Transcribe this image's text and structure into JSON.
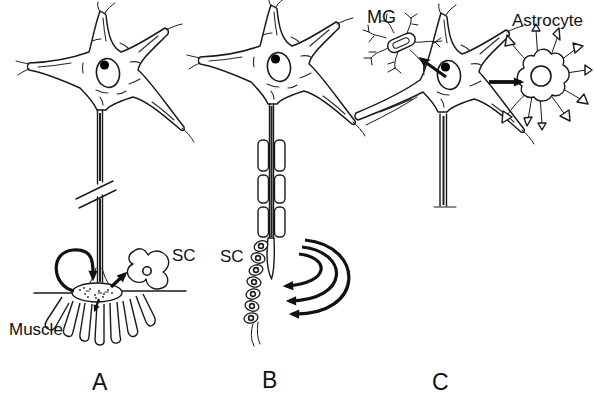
{
  "figure": {
    "colors": {
      "background": "#ffffff",
      "line": "#1a1a1a",
      "arrow": "#111111"
    },
    "panels": {
      "a": {
        "letter": "A",
        "sc_label": "SC",
        "muscle_label": "Muscle"
      },
      "b": {
        "letter": "B",
        "sc_label": "SC"
      },
      "c": {
        "letter": "C",
        "mg_label": "MG",
        "astrocyte_label": "Astrocyte"
      }
    }
  }
}
